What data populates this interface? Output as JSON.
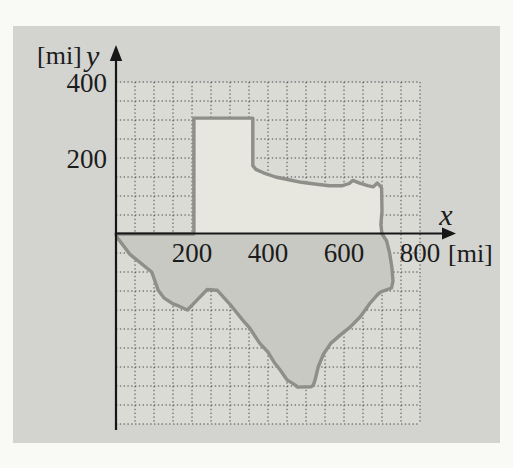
{
  "figure": {
    "y_axis": {
      "unit": "[mi]",
      "letter": "y",
      "ticks": [
        {
          "value": 400,
          "label": "400"
        },
        {
          "value": 200,
          "label": "200"
        }
      ]
    },
    "x_axis": {
      "unit": "[mi]",
      "letter": "x",
      "ticks": [
        {
          "value": 200,
          "label": "200"
        },
        {
          "value": 400,
          "label": "400"
        },
        {
          "value": 600,
          "label": "600"
        },
        {
          "value": 800,
          "label": "800"
        }
      ]
    }
  },
  "colors": {
    "page_bg": "#f9f9f6",
    "panel_bg": "#d3d3cf",
    "grid_region_bg": "#dbdbd6",
    "grid_line": "#4a4a50",
    "axis": "#161616",
    "label": "#1c1c1c",
    "texas_fill_above_axis": "#e7e7e0",
    "texas_fill_below_axis": "#c9c9c3",
    "texas_outline": "#8f8f89"
  },
  "chart_data": {
    "type": "area",
    "title": "",
    "xlabel": "x",
    "ylabel": "y",
    "unit": "mi",
    "xlim": [
      0,
      800
    ],
    "ylim": [
      -500,
      400
    ],
    "grid_step": 50,
    "grid_style": "dotted",
    "x_tick_values": [
      200,
      400,
      600,
      800
    ],
    "y_tick_values": [
      200,
      400
    ],
    "outline_points_mi": [
      [
        0,
        0
      ],
      [
        205,
        0
      ],
      [
        205,
        305
      ],
      [
        360,
        305
      ],
      [
        360,
        180
      ],
      [
        368,
        170
      ],
      [
        388,
        161
      ],
      [
        420,
        150
      ],
      [
        458,
        142
      ],
      [
        488,
        136
      ],
      [
        528,
        131
      ],
      [
        562,
        127
      ],
      [
        596,
        127
      ],
      [
        614,
        133
      ],
      [
        623,
        141
      ],
      [
        641,
        134
      ],
      [
        662,
        127
      ],
      [
        677,
        124
      ],
      [
        687,
        134
      ],
      [
        694,
        128
      ],
      [
        699,
        121
      ],
      [
        700,
        60
      ],
      [
        697,
        25
      ],
      [
        700,
        0
      ],
      [
        712,
        -18
      ],
      [
        720,
        -50
      ],
      [
        726,
        -88
      ],
      [
        729,
        -124
      ],
      [
        725,
        -142
      ],
      [
        697,
        -152
      ],
      [
        689,
        -159
      ],
      [
        668,
        -183
      ],
      [
        643,
        -218
      ],
      [
        616,
        -245
      ],
      [
        590,
        -266
      ],
      [
        565,
        -288
      ],
      [
        545,
        -318
      ],
      [
        532,
        -350
      ],
      [
        524,
        -384
      ],
      [
        519,
        -399
      ],
      [
        513,
        -402
      ],
      [
        478,
        -403
      ],
      [
        471,
        -397
      ],
      [
        450,
        -384
      ],
      [
        432,
        -358
      ],
      [
        417,
        -339
      ],
      [
        400,
        -311
      ],
      [
        378,
        -287
      ],
      [
        352,
        -248
      ],
      [
        333,
        -226
      ],
      [
        300,
        -185
      ],
      [
        266,
        -148
      ],
      [
        240,
        -146
      ],
      [
        215,
        -172
      ],
      [
        188,
        -200
      ],
      [
        166,
        -190
      ],
      [
        150,
        -184
      ],
      [
        126,
        -168
      ],
      [
        111,
        -148
      ],
      [
        94,
        -100
      ],
      [
        36,
        -53
      ],
      [
        2,
        -8
      ]
    ]
  }
}
